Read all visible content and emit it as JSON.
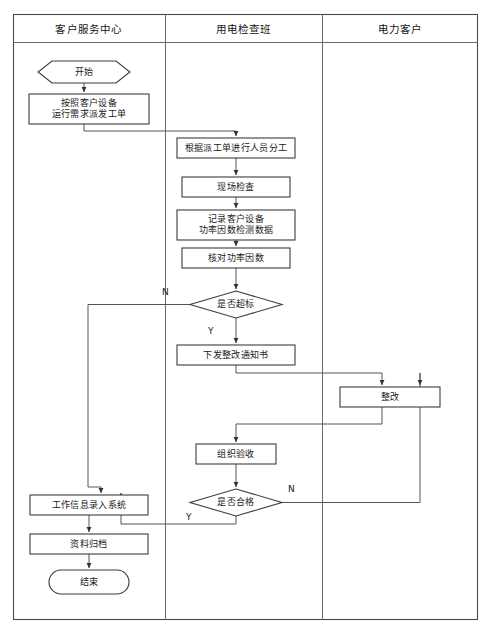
{
  "diagram": {
    "type": "swimlane-flowchart",
    "frame": {
      "x": 13,
      "y": 14,
      "width": 465,
      "height": 606
    },
    "colors": {
      "stroke": "#4a4a4a",
      "node_stroke": "#3c3c3c",
      "text": "#1a1a1a",
      "background": "#ffffff"
    },
    "lanes": [
      {
        "id": "lane-customer-service",
        "label": "客户服务中心",
        "x": 13,
        "width": 152
      },
      {
        "id": "lane-inspection-team",
        "label": "用电检查班",
        "x": 165,
        "width": 157
      },
      {
        "id": "lane-power-customer",
        "label": "电力客户",
        "x": 322,
        "width": 156
      }
    ],
    "header": {
      "y": 14,
      "height": 28
    },
    "nodes": [
      {
        "id": "start",
        "shape": "hexagon",
        "label": "开始",
        "lane": "lane-customer-service",
        "x": 38,
        "y": 61,
        "width": 92,
        "height": 22
      },
      {
        "id": "dispatch-work-order",
        "shape": "rect",
        "label": "按照客户设备\n运行需求派发工单",
        "lane": "lane-customer-service",
        "x": 29,
        "y": 94,
        "width": 120,
        "height": 30
      },
      {
        "id": "assign-personnel",
        "shape": "rect",
        "label": "根据派工单进行人员分工",
        "lane": "lane-inspection-team",
        "x": 177,
        "y": 138,
        "width": 118,
        "height": 20
      },
      {
        "id": "site-inspection",
        "shape": "rect",
        "label": "现场检查",
        "lane": "lane-inspection-team",
        "x": 182,
        "y": 177,
        "width": 108,
        "height": 20
      },
      {
        "id": "record-power-factor-data",
        "shape": "rect",
        "label": "记录客户设备\n功率因数检测数据",
        "lane": "lane-inspection-team",
        "x": 177,
        "y": 210,
        "width": 118,
        "height": 30
      },
      {
        "id": "verify-power-factor",
        "shape": "rect",
        "label": "核对功率因数",
        "lane": "lane-inspection-team",
        "x": 182,
        "y": 248,
        "width": 108,
        "height": 20
      },
      {
        "id": "decision-exceeds-standard",
        "shape": "diamond",
        "label": "是否超标",
        "lane": "lane-inspection-team",
        "x": 190,
        "y": 291,
        "width": 92,
        "height": 27
      },
      {
        "id": "issue-rectification-notice",
        "shape": "rect",
        "label": "下发整改通知书",
        "lane": "lane-inspection-team",
        "x": 177,
        "y": 345,
        "width": 118,
        "height": 20
      },
      {
        "id": "rectification",
        "shape": "rect",
        "label": "整改",
        "lane": "lane-power-customer",
        "x": 340,
        "y": 387,
        "width": 100,
        "height": 20
      },
      {
        "id": "organize-acceptance",
        "shape": "rect",
        "label": "组织验收",
        "lane": "lane-inspection-team",
        "x": 196,
        "y": 444,
        "width": 80,
        "height": 20
      },
      {
        "id": "decision-qualified",
        "shape": "diamond",
        "label": "是否合格",
        "lane": "lane-inspection-team",
        "x": 190,
        "y": 489,
        "width": 92,
        "height": 27
      },
      {
        "id": "enter-work-info-system",
        "shape": "rect",
        "label": "工作信息录入系统",
        "lane": "lane-customer-service",
        "x": 30,
        "y": 495,
        "width": 118,
        "height": 20
      },
      {
        "id": "archive-documents",
        "shape": "rect",
        "label": "资料归档",
        "lane": "lane-customer-service",
        "x": 30,
        "y": 534,
        "width": 118,
        "height": 20
      },
      {
        "id": "end",
        "shape": "stadium",
        "label": "结束",
        "lane": "lane-customer-service",
        "x": 49,
        "y": 570,
        "width": 80,
        "height": 24
      }
    ],
    "edge_labels": [
      {
        "id": "edge-label-exceeds-no",
        "text": "N",
        "x": 162,
        "y": 287
      },
      {
        "id": "edge-label-exceeds-yes",
        "text": "Y",
        "x": 208,
        "y": 326
      },
      {
        "id": "edge-label-qualified-no",
        "text": "N",
        "x": 288,
        "y": 484
      },
      {
        "id": "edge-label-qualified-yes",
        "text": "Y",
        "x": 186,
        "y": 512
      }
    ],
    "edges": [
      {
        "id": "edge-start-to-dispatch",
        "from": "start",
        "to": "dispatch-work-order"
      },
      {
        "id": "edge-dispatch-to-assign",
        "from": "dispatch-work-order",
        "to": "assign-personnel"
      },
      {
        "id": "edge-assign-to-site",
        "from": "assign-personnel",
        "to": "site-inspection"
      },
      {
        "id": "edge-site-to-record",
        "from": "site-inspection",
        "to": "record-power-factor-data"
      },
      {
        "id": "edge-record-to-verify",
        "from": "record-power-factor-data",
        "to": "verify-power-factor"
      },
      {
        "id": "edge-verify-to-decision",
        "from": "verify-power-factor",
        "to": "decision-exceeds-standard"
      },
      {
        "id": "edge-exceeds-yes-to-notice",
        "from": "decision-exceeds-standard",
        "to": "issue-rectification-notice",
        "label": "Y"
      },
      {
        "id": "edge-exceeds-no-to-entry",
        "from": "decision-exceeds-standard",
        "to": "enter-work-info-system",
        "label": "N"
      },
      {
        "id": "edge-notice-to-rectification",
        "from": "issue-rectification-notice",
        "to": "rectification"
      },
      {
        "id": "edge-rectification-to-acceptance",
        "from": "rectification",
        "to": "organize-acceptance"
      },
      {
        "id": "edge-acceptance-to-qualified",
        "from": "organize-acceptance",
        "to": "decision-qualified"
      },
      {
        "id": "edge-qualified-no-to-rectification",
        "from": "decision-qualified",
        "to": "rectification",
        "label": "N"
      },
      {
        "id": "edge-qualified-yes-to-entry",
        "from": "decision-qualified",
        "to": "enter-work-info-system",
        "label": "Y"
      },
      {
        "id": "edge-entry-to-archive",
        "from": "enter-work-info-system",
        "to": "archive-documents"
      },
      {
        "id": "edge-archive-to-end",
        "from": "archive-documents",
        "to": "end"
      }
    ]
  }
}
